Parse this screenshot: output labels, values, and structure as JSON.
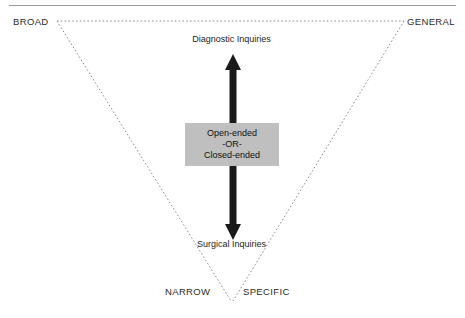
{
  "figure": {
    "corners": {
      "top_left": "BROAD",
      "top_right": "GENERAL",
      "bottom_left": "NARROW",
      "bottom_right": "SPECIFIC"
    },
    "arrow": {
      "top_label": "Diagnostic Inquiries",
      "bottom_label": "Surgical Inquiries"
    },
    "center_box": {
      "line1": "Open-ended",
      "line2": "-OR-",
      "line3": "Closed-ended"
    }
  },
  "colors": {
    "box_fill": "#bfbfbf",
    "arrow": "#1a1a1a",
    "triangle_stroke": "#8c8c8c",
    "rule": "#9a9a9a",
    "text": "#1d1d1d"
  }
}
